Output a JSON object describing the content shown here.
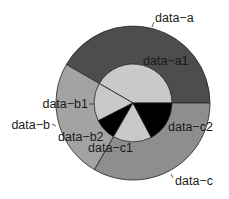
{
  "chart_data": {
    "type": "pie",
    "subtype": "nested-donut",
    "title": "",
    "center": [
      133,
      103
    ],
    "outer_radius": 77,
    "inner_radius": 39,
    "start_angle_deg": 0,
    "direction": "counterclockwise",
    "outer_ring": [
      {
        "name": "data-a",
        "value": 150,
        "percent": 41.7,
        "color": "#4d4d4d"
      },
      {
        "name": "data-b",
        "value": 90,
        "percent": 25.0,
        "color": "#a3a3a3"
      },
      {
        "name": "data-c",
        "value": 120,
        "percent": 33.3,
        "color": "#8e8e8e"
      }
    ],
    "inner_ring": [
      {
        "name": "data-a1",
        "parent": "data-a",
        "value": 150,
        "percent": 41.7,
        "color": "#c9c9c9"
      },
      {
        "name": "data-b1",
        "parent": "data-b",
        "value": 57,
        "percent": 15.8,
        "color": "#c9c9c9"
      },
      {
        "name": "data-b2",
        "parent": "data-b",
        "value": 33,
        "percent": 9.2,
        "color": "#000000"
      },
      {
        "name": "data-c1",
        "parent": "data-c",
        "value": 58,
        "percent": 16.1,
        "color": "#c9c9c9"
      },
      {
        "name": "data-c2",
        "parent": "data-c",
        "value": 62,
        "percent": 17.2,
        "color": "#000000"
      }
    ],
    "labels": [
      {
        "text": "data-a",
        "x": 155,
        "y": 22,
        "anchor": "start",
        "tick": [
          152,
          27,
          154,
          22
        ]
      },
      {
        "text": "data-a1",
        "x": 143,
        "y": 65,
        "anchor": "start",
        "tick": null
      },
      {
        "text": "data-b1",
        "x": 88,
        "y": 108,
        "anchor": "end",
        "tick": [
          89,
          104,
          94,
          104
        ]
      },
      {
        "text": "data-b",
        "x": 50,
        "y": 129,
        "anchor": "end",
        "tick": [
          52,
          124,
          56,
          126
        ]
      },
      {
        "text": "data-b2",
        "x": 58,
        "y": 141,
        "anchor": "start",
        "tick": null
      },
      {
        "text": "data-c1",
        "x": 88,
        "y": 152,
        "anchor": "start",
        "tick": null
      },
      {
        "text": "data-c2",
        "x": 168,
        "y": 131,
        "anchor": "start",
        "tick": null
      },
      {
        "text": "data-c",
        "x": 175,
        "y": 185,
        "anchor": "start",
        "tick": [
          171,
          174,
          173,
          178
        ]
      }
    ],
    "legend": null,
    "grid": false
  }
}
